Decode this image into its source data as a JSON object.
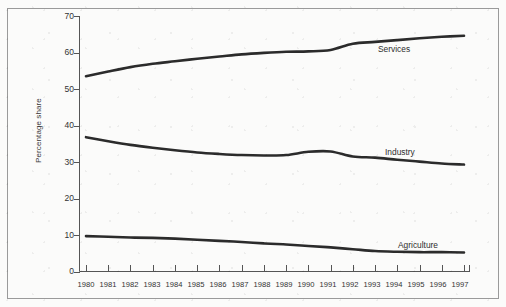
{
  "figure": {
    "background_color": "#fbfbfa",
    "border_color": "#9a9a9a",
    "line_color": "#2b2b2b",
    "axis_color": "#555555",
    "text_color": "#333333"
  },
  "axis": {
    "y_label": "Percentage share",
    "y_ticks": [
      "0",
      "10",
      "20",
      "30",
      "40",
      "50",
      "60",
      "70"
    ],
    "x_ticks": [
      "1980",
      "1981",
      "1982",
      "1983",
      "1984",
      "1985",
      "1986",
      "1987",
      "1988",
      "1989",
      "1990",
      "1991",
      "1992",
      "1993",
      "1994",
      "1995",
      "1996",
      "1997"
    ]
  },
  "series_labels": {
    "services": "Services",
    "industry": "Industry",
    "agriculture": "Agriculture"
  },
  "chart_data": {
    "type": "line",
    "title": "",
    "xlabel": "",
    "ylabel": "Percentage share",
    "xlim": [
      1980,
      1997
    ],
    "ylim": [
      0,
      70
    ],
    "yticks": [
      0,
      10,
      20,
      30,
      40,
      50,
      60,
      70
    ],
    "grid": false,
    "legend": "inline-right-of-lines",
    "x": [
      1980,
      1981,
      1982,
      1983,
      1984,
      1985,
      1986,
      1987,
      1988,
      1989,
      1990,
      1991,
      1992,
      1993,
      1994,
      1995,
      1996,
      1997
    ],
    "series": [
      {
        "name": "Services",
        "color": "#2b2b2b",
        "values": [
          53.5,
          54.8,
          56.0,
          56.9,
          57.6,
          58.3,
          58.9,
          59.5,
          59.9,
          60.2,
          60.3,
          60.7,
          62.4,
          62.9,
          63.4,
          63.9,
          64.3,
          64.6
        ]
      },
      {
        "name": "Industry",
        "color": "#2b2b2b",
        "values": [
          36.8,
          35.7,
          34.7,
          33.9,
          33.2,
          32.6,
          32.2,
          31.9,
          31.8,
          31.9,
          32.8,
          32.9,
          31.5,
          31.2,
          30.6,
          30.1,
          29.6,
          29.3
        ]
      },
      {
        "name": "Agriculture",
        "color": "#2b2b2b",
        "values": [
          9.7,
          9.5,
          9.3,
          9.2,
          9.0,
          8.7,
          8.4,
          8.1,
          7.7,
          7.4,
          7.0,
          6.6,
          6.1,
          5.6,
          5.4,
          5.3,
          5.3,
          5.2
        ]
      }
    ]
  }
}
